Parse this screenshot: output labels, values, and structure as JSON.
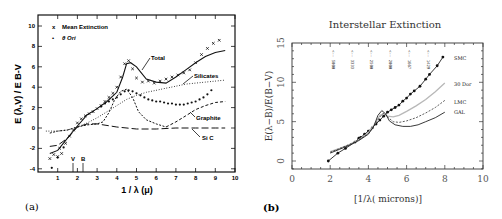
{
  "chart_data": [
    {
      "panel": "(a)",
      "type": "line",
      "title": "",
      "xlabel": "1 / λ (μ)",
      "ylabel": "E (λ,V) / E B-V",
      "xlim": [
        0,
        10
      ],
      "ylim": [
        -4,
        10
      ],
      "xticks": [
        1,
        2,
        3,
        4,
        5,
        6,
        7,
        8,
        9,
        10
      ],
      "yticks": [
        -4,
        -2,
        0,
        2,
        4,
        6,
        8,
        10
      ],
      "grid": false,
      "legend": {
        "position": "upper-left",
        "entries": [
          {
            "marker": "x",
            "label": "Mean Extinction"
          },
          {
            "marker": "•",
            "label": "θ Ori"
          }
        ]
      },
      "annotations": [
        {
          "text": "V",
          "x": 1.8
        },
        {
          "text": "B",
          "x": 2.3
        },
        {
          "text": "Total",
          "x": 5.6,
          "y": 7.0
        },
        {
          "text": "Silicates",
          "x": 8.2,
          "y": 5.3
        },
        {
          "text": "Graphite",
          "x": 8.1,
          "y": 0.8
        },
        {
          "text": "Si C",
          "x": 8.1,
          "y": -1.0
        }
      ],
      "series": [
        {
          "name": "Total",
          "style": "solid",
          "x": [
            0.6,
            1.0,
            1.5,
            2.0,
            2.5,
            3.0,
            3.5,
            4.0,
            4.3,
            4.5,
            4.7,
            5.0,
            5.5,
            6.0,
            6.5,
            7.0,
            7.5,
            8.0,
            8.5,
            9.0,
            9.5
          ],
          "y": [
            -2.5,
            -2.2,
            -1.0,
            0.2,
            1.3,
            1.9,
            2.6,
            3.5,
            5.0,
            6.3,
            6.4,
            6.0,
            4.8,
            4.5,
            4.4,
            5.0,
            5.7,
            6.4,
            7.0,
            7.4,
            7.6
          ]
        },
        {
          "name": "Silicates",
          "style": "dotted",
          "x": [
            0.4,
            1.0,
            1.5,
            2.0,
            2.5,
            3.0,
            3.5,
            4.0,
            4.5,
            5.0,
            5.5,
            6.0,
            6.5,
            7.0,
            7.5,
            8.0,
            8.5,
            9.0,
            9.5
          ],
          "y": [
            -0.3,
            -0.3,
            -0.2,
            0.1,
            0.5,
            1.0,
            1.6,
            2.2,
            2.8,
            3.2,
            3.5,
            3.7,
            3.9,
            4.1,
            4.3,
            4.4,
            4.5,
            4.6,
            4.7
          ]
        },
        {
          "name": "Silicates+Graphite (short-dash)",
          "style": "short-dash",
          "x": [
            0.6,
            1.0,
            1.5,
            2.0,
            2.5,
            3.0,
            3.3,
            3.6,
            3.9,
            4.2,
            4.5,
            4.8,
            5.1,
            5.5,
            6.0,
            6.5
          ],
          "y": [
            -0.5,
            -0.3,
            -0.2,
            0.1,
            0.3,
            0.4,
            0.6,
            1.5,
            2.8,
            3.6,
            3.8,
            3.0,
            1.6,
            0.8,
            0.4,
            0.1
          ]
        },
        {
          "name": "Graphite",
          "style": "dash",
          "x": [
            6.5,
            7.0,
            7.5,
            8.0,
            8.5,
            9.0,
            9.5
          ],
          "y": [
            0.1,
            0.6,
            1.2,
            1.8,
            2.2,
            2.5,
            2.6
          ]
        },
        {
          "name": "Si C",
          "style": "long-dash",
          "x": [
            0.6,
            1.0,
            1.5,
            2.0,
            2.5,
            3.0,
            4.0,
            5.0,
            6.0,
            7.0,
            8.0,
            9.0,
            9.5
          ],
          "y": [
            -1.8,
            -1.7,
            -1.0,
            0.1,
            0.4,
            0.4,
            0.1,
            -0.1,
            -0.1,
            0.0,
            0.0,
            0.0,
            0.0
          ]
        },
        {
          "name": "Mean Extinction",
          "style": "markers-x",
          "x": [
            0.6,
            0.8,
            1.0,
            1.1,
            1.2,
            1.4,
            1.6,
            1.8,
            2.0,
            2.2,
            2.4,
            2.6,
            2.8,
            3.0,
            3.2,
            3.4,
            3.6,
            3.8,
            4.0,
            4.2,
            4.4,
            4.6,
            4.8,
            5.0,
            5.3,
            5.6,
            5.9,
            6.2,
            6.5,
            6.8,
            7.1,
            7.4,
            7.7,
            8.0,
            8.3,
            8.6,
            8.9,
            9.2
          ],
          "y": [
            -3.0,
            -2.6,
            -2.8,
            -2.0,
            -2.5,
            -1.5,
            -0.8,
            -0.2,
            0.5,
            0.9,
            1.2,
            1.4,
            1.6,
            1.9,
            2.2,
            2.6,
            3.0,
            3.4,
            4.0,
            5.0,
            6.3,
            6.6,
            5.8,
            4.9,
            4.5,
            4.6,
            4.4,
            4.6,
            4.8,
            5.0,
            5.2,
            5.4,
            5.7,
            6.4,
            7.2,
            7.8,
            8.3,
            8.6
          ]
        },
        {
          "name": "θ Ori",
          "style": "markers-dot",
          "x": [
            0.7,
            1.0,
            1.3,
            3.2,
            3.4,
            3.6,
            3.8,
            4.0,
            4.2,
            4.4,
            4.6,
            4.8,
            5.0,
            5.2,
            5.4,
            5.6,
            5.8,
            6.0,
            6.2,
            6.4,
            6.6,
            6.8,
            7.0,
            7.2,
            7.4,
            7.6,
            7.8,
            8.0,
            8.2,
            8.4,
            8.6,
            8.8
          ],
          "y": [
            -3.9,
            -2.9,
            -1.9,
            2.1,
            2.4,
            2.6,
            2.8,
            3.0,
            3.3,
            3.6,
            3.7,
            3.6,
            3.4,
            3.2,
            3.0,
            2.8,
            2.7,
            2.6,
            2.6,
            2.5,
            2.4,
            2.4,
            2.3,
            2.3,
            2.3,
            2.4,
            2.5,
            2.6,
            2.8,
            3.0,
            3.3,
            3.7
          ]
        }
      ]
    },
    {
      "panel": "(b)",
      "type": "line",
      "title": "Interstellar Extinction",
      "xlabel": "[1/λ( microns)]",
      "ylabel": "E(λ−B)/E(B−V)",
      "xlim": [
        0,
        10
      ],
      "ylim": [
        -1,
        15
      ],
      "xticks": [
        0,
        2,
        4,
        6,
        8,
        10
      ],
      "yticks": [
        0,
        5,
        10,
        15
      ],
      "grid": false,
      "legend": {
        "position": "right-inline",
        "entries": [
          {
            "label": "SMC"
          },
          {
            "label": "30 Dor"
          },
          {
            "label": "LMC"
          },
          {
            "label": "GAL"
          }
        ]
      },
      "annotations": [
        {
          "text": "<-- 5000",
          "x": 2
        },
        {
          "text": "<-- 3333",
          "x": 3
        },
        {
          "text": "<-- 2500",
          "x": 4
        },
        {
          "text": "<-- 2000",
          "x": 5
        },
        {
          "text": "<-- 1667",
          "x": 6
        },
        {
          "text": "<-- 1429",
          "x": 7
        }
      ],
      "series": [
        {
          "name": "SMC",
          "style": "solid-markers",
          "x": [
            1.9,
            2.4,
            2.8,
            3.3,
            3.5,
            3.6,
            3.8,
            4.0,
            4.2,
            4.4,
            4.6,
            4.8,
            5.0,
            5.2,
            5.4,
            5.6,
            5.8,
            6.0,
            6.2,
            6.4,
            6.7,
            7.0,
            7.2,
            7.6,
            7.9
          ],
          "y": [
            0.0,
            1.0,
            1.6,
            2.4,
            2.9,
            3.0,
            3.4,
            3.8,
            4.2,
            4.7,
            5.2,
            5.7,
            6.2,
            6.5,
            6.8,
            7.1,
            7.6,
            8.0,
            8.5,
            8.9,
            9.5,
            10.4,
            11.0,
            12.1,
            13.2
          ]
        },
        {
          "name": "30 Dor",
          "style": "light-solid",
          "x": [
            2.0,
            2.5,
            3.0,
            3.5,
            4.0,
            4.3,
            4.6,
            4.8,
            5.0,
            5.3,
            5.6,
            6.0,
            6.5,
            7.0,
            7.5,
            8.0
          ],
          "y": [
            1.2,
            1.6,
            2.1,
            2.7,
            3.6,
            4.6,
            5.8,
            6.0,
            5.7,
            5.6,
            5.8,
            6.3,
            7.0,
            7.8,
            8.8,
            9.9
          ]
        },
        {
          "name": "LMC",
          "style": "dashed",
          "x": [
            2.0,
            2.5,
            3.0,
            3.5,
            4.0,
            4.3,
            4.6,
            4.8,
            5.0,
            5.3,
            5.6,
            6.0,
            6.5,
            7.0,
            7.5,
            8.0
          ],
          "y": [
            1.1,
            1.6,
            2.1,
            2.7,
            3.5,
            4.4,
            5.6,
            6.1,
            5.6,
            5.0,
            4.9,
            5.1,
            5.5,
            6.1,
            6.8,
            7.7
          ]
        },
        {
          "name": "GAL",
          "style": "solid",
          "x": [
            2.0,
            2.5,
            3.0,
            3.5,
            4.0,
            4.3,
            4.5,
            4.7,
            4.9,
            5.1,
            5.4,
            5.8,
            6.2,
            6.6,
            7.0,
            7.5,
            8.0
          ],
          "y": [
            1.0,
            1.5,
            2.0,
            2.6,
            3.4,
            4.5,
            5.8,
            6.4,
            6.0,
            5.1,
            4.6,
            4.4,
            4.4,
            4.6,
            5.0,
            5.5,
            6.2
          ]
        }
      ]
    }
  ],
  "labels": {
    "panel_a": "(a)",
    "panel_b": "(b)",
    "title_b": "Interstellar Extinction",
    "xlabel_a": "1 / λ (μ)",
    "ylabel_a": "E (λ,V) / E B-V",
    "xlabel_b": "[1/λ( microns)]",
    "ylabel_b": "E(λ−B)/E(B−V)",
    "legend_a_1": "Mean Extinction",
    "legend_a_2": "θ Ori",
    "marker_a_1": "x",
    "marker_a_2": "•",
    "ann_total": "Total",
    "ann_silicates": "Silicates",
    "ann_graphite": "Graphite",
    "ann_sic": "Si C",
    "ann_v": "V",
    "ann_b": "B",
    "leg_smc": "SMC",
    "leg_30dor": "30 Dor",
    "leg_lmc": "LMC",
    "leg_gal": "GAL"
  },
  "colors": {
    "ink": "#111111",
    "ink_b": "#222222",
    "light_30dor": "#b8b8b8"
  }
}
